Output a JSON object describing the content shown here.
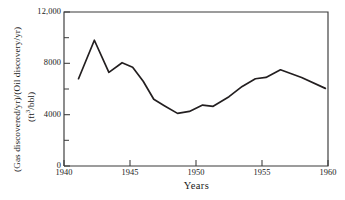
{
  "chart_data": {
    "type": "line",
    "title": "",
    "xlabel": "Years",
    "ylabel_line1": "(Gas discovered/yr)/(Oil discovery/yr)",
    "ylabel_line2_prefix": "(ft",
    "ylabel_line2_sup": "3",
    "ylabel_line2_suffix": "/bbl)",
    "ylabel_full": "(Gas discovered/yr)/(Oil discovery/yr) (ft3/bbl)",
    "xlim": [
      1940,
      1960
    ],
    "ylim": [
      0,
      12000
    ],
    "grid": false,
    "legend": "none",
    "y_ticks_major": [
      0,
      4000,
      8000,
      12000
    ],
    "y_tick_labels": [
      "0",
      "4000",
      "8000",
      "12,000"
    ],
    "y_ticks_minor": [
      2000,
      6000,
      10000
    ],
    "x_ticks": [
      1940,
      1945,
      1950,
      1955,
      1960
    ],
    "x_tick_labels": [
      "1940",
      "1945",
      "1950",
      "1955",
      "1960"
    ],
    "series": [
      {
        "name": "Gas/Oil discovery ratio",
        "color": "#231f20",
        "x": [
          1941.1,
          1942.3,
          1943.4,
          1944.4,
          1945.2,
          1946.0,
          1946.8,
          1947.6,
          1948.6,
          1949.5,
          1950.5,
          1951.3,
          1952.5,
          1953.5,
          1954.5,
          1955.3,
          1956.4,
          1958.0,
          1959.8
        ],
        "values": [
          6800,
          9800,
          7300,
          8050,
          7700,
          6600,
          5200,
          4700,
          4100,
          4250,
          4750,
          4650,
          5400,
          6200,
          6800,
          6900,
          7500,
          6900,
          6050
        ]
      }
    ]
  }
}
